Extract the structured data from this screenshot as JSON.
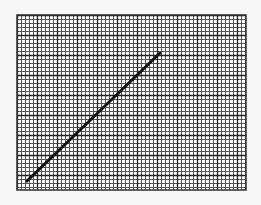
{
  "chart_data": {
    "type": "line",
    "title": "",
    "xlabel": "",
    "ylabel": "",
    "grid": true,
    "legend": null,
    "grid_style": {
      "minor_spacing_px": 4,
      "major_every": 5,
      "minor_color": "#555555",
      "major_color": "#222222",
      "background": "#ffffff"
    },
    "plot_area": {
      "left": 17,
      "top": 15,
      "right": 246,
      "bottom": 190
    },
    "series": [
      {
        "name": "line",
        "color": "#111111",
        "points_px": [
          [
            27,
            181
          ],
          [
            160,
            53
          ]
        ]
      }
    ]
  }
}
